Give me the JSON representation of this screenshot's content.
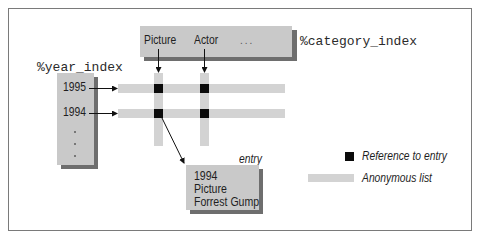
{
  "diagram": {
    "category_index": {
      "label": "%category_index",
      "columns": [
        "Picture",
        "Actor"
      ],
      "ellipsis": "..."
    },
    "year_index": {
      "label": "%year_index",
      "rows": [
        "1995",
        "1994"
      ],
      "continuation": "vertical-dots"
    },
    "entry": {
      "label": "entry",
      "lines": [
        "1994",
        "Picture",
        "Forrest Gump"
      ]
    },
    "legend": {
      "items": [
        {
          "symbol": "black-square",
          "label": "Reference to entry"
        },
        {
          "symbol": "gray-bar",
          "label": "Anonymous list"
        }
      ]
    },
    "colors": {
      "box_fill": "#c9c9c9",
      "box_shadow": "#6e6e6e",
      "list_bar": "#d3d3d3",
      "reference": "#0b0b0b",
      "frame": "#7a7a7a"
    }
  }
}
